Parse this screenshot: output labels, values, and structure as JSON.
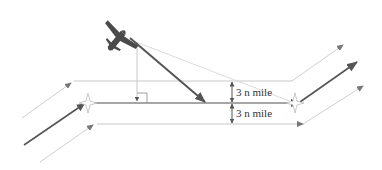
{
  "diagram": {
    "labels": {
      "upper_width": "3 n mile",
      "lower_width": "3 n mile"
    },
    "colors": {
      "background": "#ffffff",
      "route": "#555555",
      "boundary": "#c8c8c8",
      "aircraft": "#4a4a4a",
      "guide": "#d0d0d0"
    },
    "elements": [
      {
        "id": "aircraft",
        "desc": "aircraft symbol heading toward route"
      },
      {
        "id": "intercept-arrow",
        "desc": "aircraft track to route centerline"
      },
      {
        "id": "route-centerline",
        "desc": "route centerline between waypoints"
      },
      {
        "id": "upper-boundary",
        "desc": "upper airspace boundary (3 n mile)"
      },
      {
        "id": "lower-boundary",
        "desc": "lower airspace boundary (3 n mile)"
      },
      {
        "id": "perpendicular",
        "desc": "perpendicular drop from aircraft to route with right-angle mark"
      }
    ]
  }
}
